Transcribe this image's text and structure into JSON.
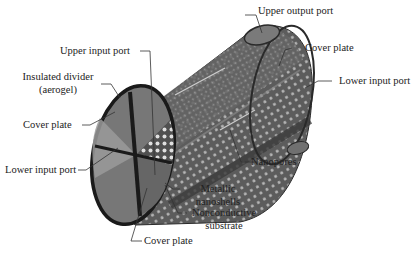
{
  "diagram": {
    "colors": {
      "body": "#5f5f5f",
      "body_dark": "#3a3a3a",
      "end_cap": "#7a7a7a",
      "rim": "#1e1e1e",
      "pores": "#bdbdbd",
      "leader": "#333333",
      "text": "#222222"
    },
    "labels": {
      "upper_output_port": "Upper output port",
      "cover_plate_right": "Cover plate",
      "lower_input_port_right": "Lower input port",
      "upper_input_port": "Upper input port",
      "insulated_divider_line1": "Insulated divider",
      "insulated_divider_line2": "(aerogel)",
      "cover_plate_left": "Cover plate",
      "lower_input_port_left": "Lower input port",
      "nanopores": "Nanopores",
      "metallic_nanoshells_line1": "Metallic",
      "metallic_nanoshells_line2": "nanoshells",
      "nonconductive_substrate_line1": "Nonconductive",
      "nonconductive_substrate_line2": "substrate",
      "cover_plate_bottom": "Cover plate"
    }
  }
}
